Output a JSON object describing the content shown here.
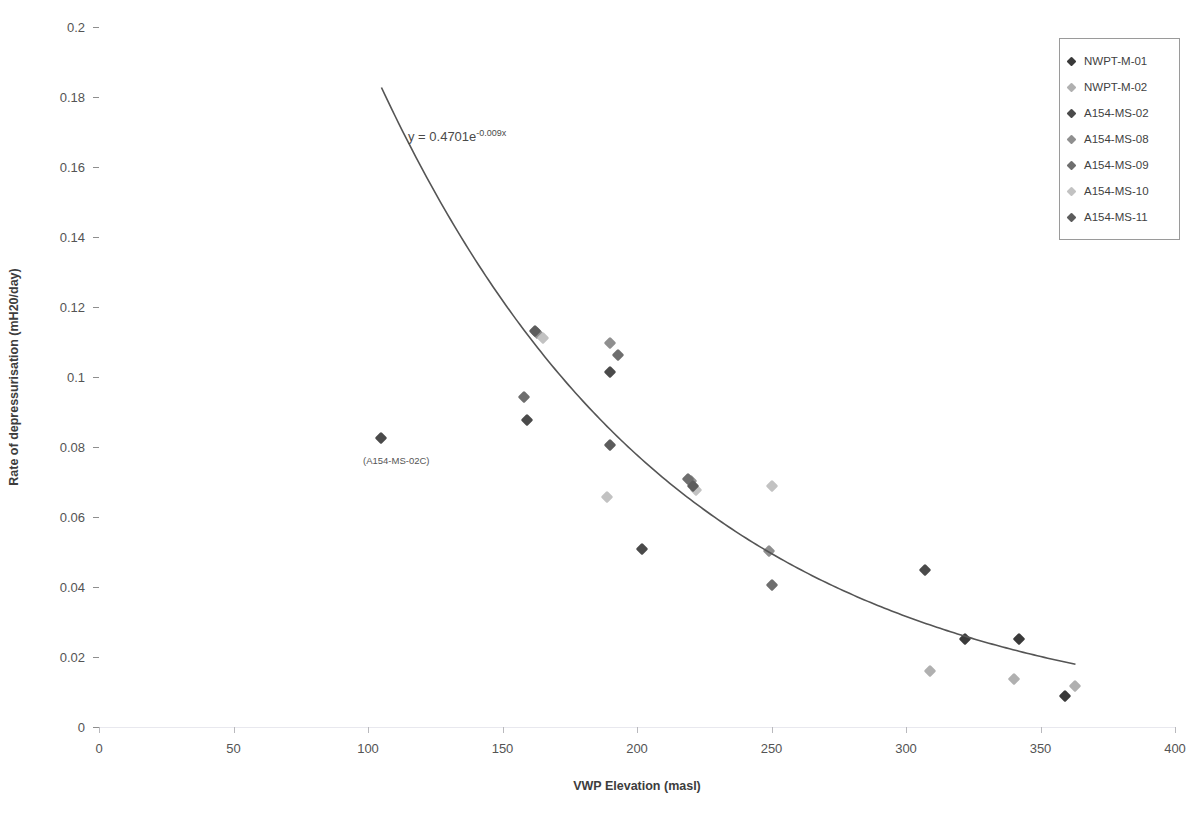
{
  "chart_data": {
    "type": "scatter",
    "title": "",
    "xlabel": "VWP Elevation  (masl)",
    "ylabel": "Rate of depressurisation (mH20/day)",
    "xlim": [
      0,
      400
    ],
    "ylim": [
      0,
      0.2
    ],
    "xticks": [
      0,
      50,
      100,
      150,
      200,
      250,
      300,
      350,
      400
    ],
    "yticks": [
      0,
      0.02,
      0.04,
      0.06,
      0.08,
      0.1,
      0.12,
      0.14,
      0.16,
      0.18,
      0.2
    ],
    "xtick_labels": [
      "0",
      "50",
      "100",
      "150",
      "200",
      "250",
      "300",
      "350",
      "400"
    ],
    "ytick_labels": [
      "0",
      "0.02",
      "0.04",
      "0.06",
      "0.08",
      "0.1",
      "0.12",
      "0.14",
      "0.16",
      "0.18",
      "0.2"
    ],
    "grid": "horizontal",
    "legend_position": "top-right",
    "trendline": {
      "equation_display": "y = 0.4701e",
      "exponent_display": "-0.009x",
      "type": "exponential",
      "a": 0.4701,
      "b": -0.009,
      "x_start": 105,
      "x_end": 363,
      "color": "#555555"
    },
    "annotations": [
      {
        "text": "(A154-MS-02C)",
        "x": 105,
        "y": 0.0755
      }
    ],
    "series": [
      {
        "name": "NWPT-M-01",
        "color": "#3a3a3a",
        "points": [
          {
            "x": 322,
            "y": 0.0251
          },
          {
            "x": 342,
            "y": 0.0252
          },
          {
            "x": 359,
            "y": 0.009
          }
        ]
      },
      {
        "name": "NWPT-M-02",
        "color": "#b0b0b0",
        "points": [
          {
            "x": 309,
            "y": 0.0159
          },
          {
            "x": 340,
            "y": 0.0137
          },
          {
            "x": 363,
            "y": 0.0116
          }
        ]
      },
      {
        "name": "A154-MS-02",
        "color": "#4a4a4a",
        "points": [
          {
            "x": 105,
            "y": 0.0826
          },
          {
            "x": 159,
            "y": 0.0878
          },
          {
            "x": 190,
            "y": 0.1013
          },
          {
            "x": 202,
            "y": 0.0508
          },
          {
            "x": 307,
            "y": 0.0449
          }
        ]
      },
      {
        "name": "A154-MS-08",
        "color": "#8f8f8f",
        "points": [
          {
            "x": 163,
            "y": 0.1127
          },
          {
            "x": 190,
            "y": 0.1097
          },
          {
            "x": 220,
            "y": 0.0703
          },
          {
            "x": 249,
            "y": 0.0504
          }
        ]
      },
      {
        "name": "A154-MS-09",
        "color": "#6e6e6e",
        "points": [
          {
            "x": 158,
            "y": 0.0942
          },
          {
            "x": 193,
            "y": 0.1064
          },
          {
            "x": 219,
            "y": 0.0709
          },
          {
            "x": 250,
            "y": 0.0406
          }
        ]
      },
      {
        "name": "A154-MS-10",
        "color": "#c2c2c2",
        "points": [
          {
            "x": 165,
            "y": 0.1111
          },
          {
            "x": 189,
            "y": 0.0658
          },
          {
            "x": 222,
            "y": 0.0676
          },
          {
            "x": 250,
            "y": 0.069
          }
        ]
      },
      {
        "name": "A154-MS-11",
        "color": "#5c5c5c",
        "points": [
          {
            "x": 162,
            "y": 0.1131
          },
          {
            "x": 190,
            "y": 0.0806
          },
          {
            "x": 221,
            "y": 0.0688
          }
        ]
      }
    ]
  },
  "legend": {
    "items": [
      {
        "label": "NWPT-M-01",
        "color": "#3a3a3a"
      },
      {
        "label": "NWPT-M-02",
        "color": "#b0b0b0"
      },
      {
        "label": "A154-MS-02",
        "color": "#4a4a4a"
      },
      {
        "label": "A154-MS-08",
        "color": "#8f8f8f"
      },
      {
        "label": "A154-MS-09",
        "color": "#6e6e6e"
      },
      {
        "label": "A154-MS-10",
        "color": "#c2c2c2"
      },
      {
        "label": "A154-MS-11",
        "color": "#5c5c5c"
      }
    ]
  }
}
